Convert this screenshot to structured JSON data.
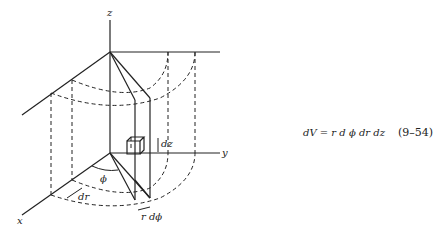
{
  "diagram": {
    "axes": {
      "x": "x",
      "y": "y",
      "z": "z"
    },
    "labels": {
      "phi": "ϕ",
      "dr": "dr",
      "dz": "dz",
      "rdphi": "r dϕ"
    },
    "equation": {
      "text": "dV = r d ϕ dr dz",
      "number": "(9–54)"
    }
  }
}
